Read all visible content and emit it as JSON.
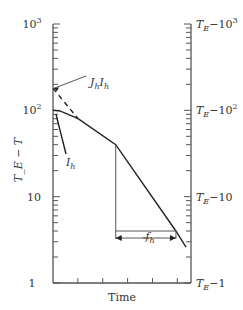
{
  "chart_data": {
    "type": "line",
    "title": "",
    "xlabel": "Time",
    "ylabel": "T_E − T",
    "y_scale": "log",
    "ylim": [
      1,
      1000
    ],
    "left_tick_labels": [
      {
        "value": 1,
        "label": "1"
      },
      {
        "value": 10,
        "label": "10"
      },
      {
        "value": 100,
        "label": "10",
        "sup": "2"
      },
      {
        "value": 1000,
        "label": "10",
        "sup": "3"
      }
    ],
    "right_tick_labels": [
      {
        "value": 1,
        "base": "T",
        "sub": "E",
        "rest": "−1"
      },
      {
        "value": 10,
        "base": "T",
        "sub": "E",
        "rest": "−10"
      },
      {
        "value": 100,
        "base": "T",
        "sub": "E",
        "rest": "−10",
        "sup": "2"
      },
      {
        "value": 1000,
        "base": "T",
        "sub": "E",
        "rest": "−10",
        "sup": "3"
      }
    ],
    "x_ticks": [
      1,
      2,
      3,
      4,
      5
    ],
    "xlim": [
      0,
      5.5
    ],
    "series": [
      {
        "name": "heating curve",
        "style": "solid",
        "points": [
          [
            0,
            100
          ],
          [
            0.3,
            98
          ],
          [
            1.0,
            80
          ],
          [
            2.5,
            40
          ],
          [
            4.9,
            4
          ],
          [
            5.3,
            2.6
          ]
        ]
      },
      {
        "name": "extrapolated straight line",
        "style": "dashed",
        "points": [
          [
            0,
            180
          ],
          [
            1.0,
            80
          ]
        ]
      }
    ],
    "annotations": [
      {
        "text": "J",
        "sub1": "h",
        "text2": "I",
        "sub2": "h",
        "points_to": [
          0,
          180
        ],
        "meaning": "J_h I_h"
      },
      {
        "text": "I",
        "sub": "h",
        "points_to": [
          0,
          100
        ],
        "meaning": "I_h"
      },
      {
        "text": "f",
        "sub": "h",
        "meaning": "f_h (time for one log cycle)",
        "from_x": 2.5,
        "to_x": 4.9,
        "y_value": 4
      }
    ],
    "grid": false,
    "legend": "none"
  }
}
